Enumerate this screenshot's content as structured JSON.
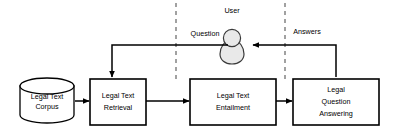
{
  "diagram": {
    "type": "flowchart",
    "nodes": {
      "corpus": {
        "name": "legal-text-corpus",
        "shape": "cylinder",
        "line1": "Legal Text",
        "line2": "Corpus"
      },
      "retrieval": {
        "name": "legal-text-retrieval",
        "shape": "rectangle",
        "line1": "Legal Text",
        "line2": "Retrieval"
      },
      "entailment": {
        "name": "legal-text-entailment",
        "shape": "rectangle",
        "line1": "Legal Text",
        "line2": "Entailment"
      },
      "qa": {
        "name": "legal-question-answering",
        "shape": "rectangle",
        "line1": "Legal",
        "line2": "Question",
        "line3": "Answering"
      },
      "user": {
        "name": "user-actor",
        "shape": "person",
        "label": "User"
      }
    },
    "edges": [
      {
        "id": "corpus-to-retrieval",
        "label": ""
      },
      {
        "id": "retrieval-to-entailment",
        "label": ""
      },
      {
        "id": "entailment-to-qa",
        "label": ""
      },
      {
        "id": "user-to-retrieval",
        "label": "Question"
      },
      {
        "id": "qa-to-user",
        "label": "Answers"
      }
    ],
    "dividers": [
      {
        "id": "divider-left",
        "style": "dashed"
      },
      {
        "id": "divider-right",
        "style": "dashed"
      }
    ],
    "colors": {
      "stroke": "#000000",
      "box_fill": "#ffffff",
      "actor_fill": "#e9e9e9",
      "actor_stroke": "#3a3a3a",
      "divider": "#555555",
      "background": "#ffffff"
    }
  }
}
